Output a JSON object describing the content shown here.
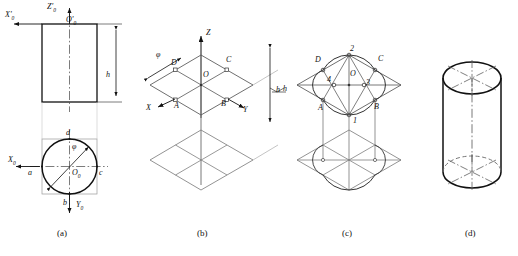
{
  "figure": {
    "panels": [
      {
        "key": "a",
        "caption": "(a)",
        "caption_x": 60,
        "caption_y": 232,
        "description": "Two-view orthographic drawing: front view rectangle with height h, top view circle of diameter phi inscribed in square",
        "labels": [
          {
            "name": "axis-label-z0-prime",
            "text": "Z'",
            "sub": "0",
            "x": 47,
            "y": 4
          },
          {
            "name": "axis-label-o0-prime",
            "text": "O'",
            "sub": "0",
            "x": 66,
            "y": 17
          },
          {
            "name": "axis-label-x0-prime",
            "text": "X'",
            "sub": "0",
            "x": 6,
            "y": 12
          },
          {
            "name": "dim-label-h-front",
            "text": "h",
            "sub": "",
            "x": 106,
            "y": 76
          },
          {
            "name": "point-label-d",
            "text": "d",
            "sub": "",
            "x": 66,
            "y": 132
          },
          {
            "name": "point-label-b",
            "text": "b",
            "sub": "",
            "x": 66,
            "y": 207
          },
          {
            "name": "point-label-a",
            "text": "a",
            "sub": "",
            "x": 23,
            "y": 176
          },
          {
            "name": "point-label-c",
            "text": "c",
            "sub": "",
            "x": 103,
            "y": 176
          },
          {
            "name": "dim-label-phi-top",
            "text": "φ",
            "sub": "",
            "x": 70,
            "y": 148
          },
          {
            "name": "axis-label-x0",
            "text": "X",
            "sub": "0",
            "x": 9,
            "y": 163
          },
          {
            "name": "axis-label-o0",
            "text": "O",
            "sub": "0",
            "x": 68,
            "y": 175
          },
          {
            "name": "axis-label-y0",
            "text": "Y",
            "sub": "0",
            "x": 80,
            "y": 207
          }
        ]
      },
      {
        "key": "b",
        "caption": "(b)",
        "caption_x": 200,
        "caption_y": 232,
        "description": "Isometric axes X Y Z with top and bottom rhombus circumscribing squares, diameter phi and height h marked",
        "labels": [
          {
            "name": "axis-label-z",
            "text": "Z",
            "sub": "",
            "x": 198,
            "y": 29
          },
          {
            "name": "axis-label-x",
            "text": "X",
            "sub": "",
            "x": 147,
            "y": 92
          },
          {
            "name": "axis-label-y",
            "text": "Y",
            "sub": "",
            "x": 245,
            "y": 98
          },
          {
            "name": "point-label-d",
            "text": "D",
            "sub": "",
            "x": 172,
            "y": 62
          },
          {
            "name": "point-label-c",
            "text": "C",
            "sub": "",
            "x": 227,
            "y": 59
          },
          {
            "name": "point-label-a",
            "text": "A",
            "sub": "",
            "x": 175,
            "y": 95
          },
          {
            "name": "point-label-b",
            "text": "B",
            "sub": "",
            "x": 222,
            "y": 94
          },
          {
            "name": "point-label-o",
            "text": "O",
            "sub": "",
            "x": 202,
            "y": 74
          },
          {
            "name": "dim-label-phi",
            "text": "φ",
            "sub": "",
            "x": 157,
            "y": 54
          },
          {
            "name": "dim-label-h",
            "text": "h",
            "sub": "",
            "x": 274,
            "y": 92
          }
        ]
      },
      {
        "key": "c",
        "caption": "(c)",
        "caption_x": 345,
        "caption_y": 232,
        "description": "Four-centre approximate ellipse construction: centres 1, 2, 3, 4 with arcs drawn through tangent points A, B, C, D on both top and bottom rhombus",
        "labels": [
          {
            "name": "center-label-2",
            "text": "2",
            "sub": "",
            "x": 349,
            "y": 48
          },
          {
            "name": "center-label-1",
            "text": "1",
            "sub": "",
            "x": 352,
            "y": 124
          },
          {
            "name": "center-label-3",
            "text": "3",
            "sub": "",
            "x": 366,
            "y": 84
          },
          {
            "name": "center-label-4",
            "text": "4",
            "sub": "",
            "x": 330,
            "y": 80
          },
          {
            "name": "point-label-d",
            "text": "D",
            "sub": "",
            "x": 315,
            "y": 60
          },
          {
            "name": "point-label-c",
            "text": "C",
            "sub": "",
            "x": 378,
            "y": 59
          },
          {
            "name": "point-label-a",
            "text": "A",
            "sub": "",
            "x": 319,
            "y": 106
          },
          {
            "name": "point-label-b",
            "text": "B",
            "sub": "",
            "x": 374,
            "y": 105
          },
          {
            "name": "point-label-o",
            "text": "O",
            "sub": "",
            "x": 349,
            "y": 74
          },
          {
            "name": "dim-label-h",
            "text": "h",
            "sub": "",
            "x": 276,
            "y": 92
          }
        ]
      },
      {
        "key": "d",
        "caption": "(d)",
        "caption_x": 468,
        "caption_y": 232,
        "description": "Finished isometric cylinder with visible top ellipse, hidden bottom ellipse and centre lines",
        "labels": []
      }
    ],
    "captions": [
      "(a)",
      "(b)",
      "(c)",
      "(d)"
    ],
    "colors": {
      "outline": "#111111",
      "construction": "#555555",
      "hidden": "#666666",
      "centerline": "#444444",
      "background": "#ffffff"
    }
  }
}
